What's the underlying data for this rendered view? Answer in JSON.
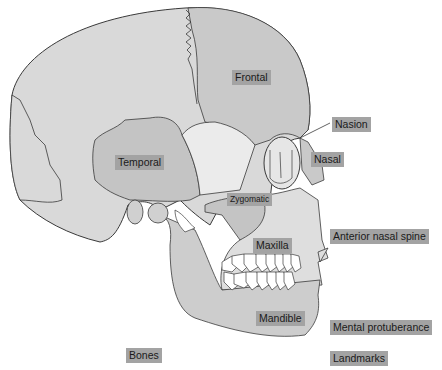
{
  "diagram": {
    "colors": {
      "bone_base": "#d9d9d9",
      "bone_frontal": "#c9c9c9",
      "bone_temporal": "#c4c4c4",
      "bone_light": "#ebebeb",
      "outline": "#3a3a3a",
      "label_bg": "#a3a3a3",
      "label_text": "#1a1a1a",
      "teeth": "#ffffff"
    },
    "bone_labels": {
      "frontal": "Frontal",
      "temporal": "Temporal",
      "zygomatic": "Zygomatic",
      "maxilla": "Maxilla",
      "mandible": "Mandible",
      "nasal": "Nasal"
    },
    "landmark_labels": {
      "nasion": "Nasion",
      "anterior_nasal_spine": "Anterior nasal spine",
      "mental_protuberance": "Mental protuberance"
    },
    "legend": {
      "bones": "Bones",
      "landmarks": "Landmarks"
    }
  }
}
